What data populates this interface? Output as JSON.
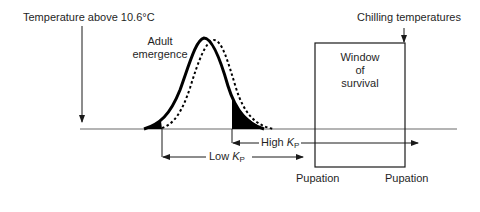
{
  "labels": {
    "temperature_above": "Temperature above 10.6°C",
    "adult_emergence_line1": "Adult",
    "adult_emergence_line2": "emergence",
    "chilling_temperatures": "Chilling temperatures",
    "window_line1": "Window",
    "window_line2": "of",
    "window_line3": "survival",
    "high_kp_prefix": "High ",
    "low_kp_prefix": "Low ",
    "k_symbol": "K",
    "k_subscript": "P",
    "pupation_left": "Pupation",
    "pupation_right": "Pupation"
  },
  "curves": [
    {
      "name": "Low KP emergence distribution",
      "style": "solid",
      "peak_x": 204
    },
    {
      "name": "High KP emergence distribution",
      "style": "dotted",
      "peak_x": 214
    }
  ],
  "colors": {
    "line": "#1a1a1a",
    "baseline": "#6b6b6b",
    "fill": "#000000",
    "background": "#ffffff"
  }
}
